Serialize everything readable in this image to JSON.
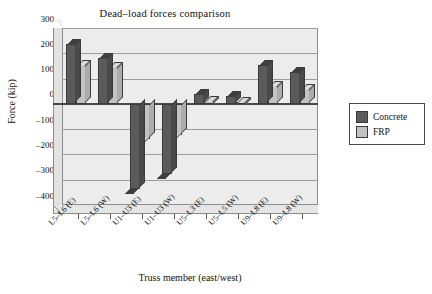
{
  "chart_data": {
    "type": "bar",
    "title": "Dead–load forces comparison",
    "xlabel": "Truss member (east/west)",
    "ylabel": "Force (kip)",
    "ylim": [
      -400,
      300
    ],
    "yticks": [
      300,
      200,
      100,
      0,
      -100,
      -200,
      -300,
      -400
    ],
    "ytick_labels": [
      "300",
      "200",
      "100",
      "0",
      "–100",
      "–200",
      "–300",
      "–400"
    ],
    "grid": true,
    "legend_position": "right",
    "categories": [
      "L5–L6 (E)",
      "L5–L6 (W)",
      "U1–U3 (E)",
      "U1–U3 (W)",
      "U5–L3 (E)",
      "U5–L5 (W)",
      "U9–L8 (E)",
      "U9–L8 (W)"
    ],
    "series": [
      {
        "name": "Concrete",
        "color": "#5b5b5b",
        "values": [
          235,
          180,
          -335,
          -278,
          40,
          32,
          152,
          125
        ]
      },
      {
        "name": "FRP",
        "color": "#c2c2c2",
        "values": [
          155,
          145,
          -140,
          -123,
          12,
          8,
          72,
          58
        ]
      }
    ]
  },
  "legend": {
    "items": [
      {
        "label": "Concrete",
        "swatch": "concrete"
      },
      {
        "label": "FRP",
        "swatch": "frp"
      }
    ]
  }
}
